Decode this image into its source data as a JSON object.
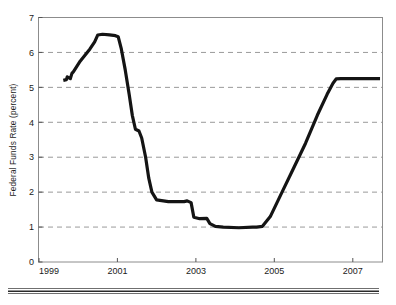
{
  "figure": {
    "background_color": "#ffffff",
    "line_color": "#141414",
    "grid_color": "#9a9a9a",
    "frame_color": "#8c8c8c"
  },
  "axis": {
    "y_title": "Federal Funds Rate (percent)",
    "y_ticks": [
      "0",
      "1",
      "2",
      "3",
      "4",
      "5",
      "6",
      "7"
    ],
    "x_ticks": [
      "1999",
      "2001",
      "2003",
      "2005",
      "2007"
    ]
  },
  "chart_data": {
    "type": "line",
    "title": "",
    "subtitle": "",
    "xlabel": "",
    "ylabel": "Federal Funds Rate (percent)",
    "xlim": [
      1999.0,
      2007.75
    ],
    "ylim": [
      0,
      7
    ],
    "xticks": [
      1999,
      2001,
      2003,
      2005,
      2007
    ],
    "xtick_labels": [
      "1999",
      "2001",
      "2003",
      "2005",
      "2007"
    ],
    "yticks": [
      0,
      1,
      2,
      3,
      4,
      5,
      6,
      7
    ],
    "ytick_labels": [
      "0",
      "1",
      "2",
      "3",
      "4",
      "5",
      "6",
      "7"
    ],
    "grid": "horizontal-dashed",
    "gridlines_y": [
      1,
      2,
      3,
      4,
      5,
      6
    ],
    "legend": "none",
    "annotations": [],
    "series": [
      {
        "name": "Federal Funds Rate",
        "color": "#141414",
        "x": [
          1999.62,
          1999.7,
          1999.72,
          1999.8,
          1999.84,
          1999.88,
          2000.05,
          2000.3,
          2000.42,
          2000.5,
          2000.62,
          2000.8,
          2000.95,
          2001.02,
          2001.1,
          2001.2,
          2001.3,
          2001.38,
          2001.46,
          2001.55,
          2001.62,
          2001.72,
          2001.8,
          2001.88,
          2002.0,
          2002.3,
          2002.7,
          2002.78,
          2002.88,
          2002.95,
          2003.1,
          2003.28,
          2003.36,
          2003.5,
          2003.7,
          2004.1,
          2004.45,
          2004.55,
          2004.7,
          2004.9,
          2005.2,
          2005.5,
          2005.8,
          2006.1,
          2006.35,
          2006.5,
          2006.58,
          2006.7,
          2007.2,
          2007.7
        ],
        "y": [
          5.2,
          5.22,
          5.3,
          5.25,
          5.4,
          5.45,
          5.75,
          6.1,
          6.3,
          6.5,
          6.52,
          6.5,
          6.48,
          6.45,
          6.1,
          5.5,
          4.8,
          4.2,
          3.8,
          3.75,
          3.55,
          3.0,
          2.4,
          2.0,
          1.78,
          1.73,
          1.73,
          1.75,
          1.7,
          1.28,
          1.24,
          1.25,
          1.1,
          1.02,
          1.0,
          0.98,
          1.0,
          1.0,
          1.02,
          1.3,
          2.0,
          2.7,
          3.4,
          4.2,
          4.8,
          5.12,
          5.24,
          5.25,
          5.25,
          5.25
        ]
      }
    ]
  },
  "divider": {
    "present": true
  }
}
